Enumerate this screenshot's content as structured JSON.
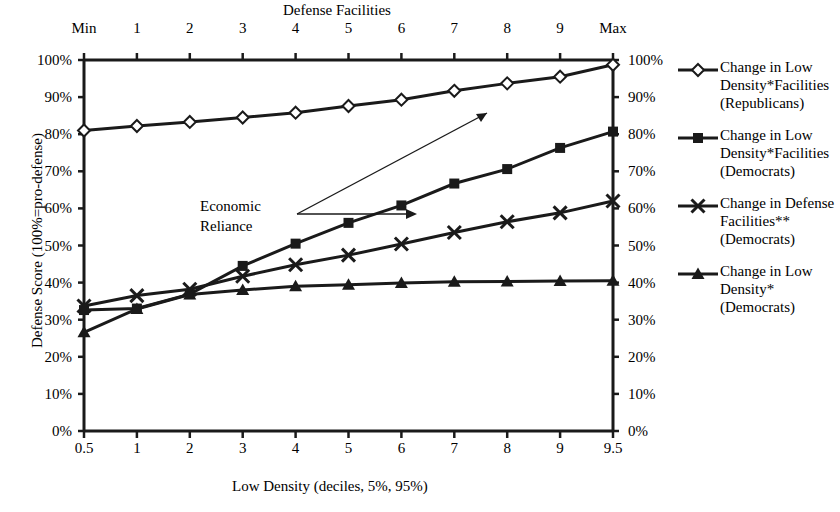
{
  "chart_data": {
    "type": "line",
    "title": "Defense Facilities",
    "xlabel": "Low Density (deciles, 5%, 95%)",
    "ylabel": "Defense Score (100%=pro-defense)",
    "ylim": [
      0,
      100
    ],
    "ytick_labels": [
      "0%",
      "10%",
      "20%",
      "30%",
      "40%",
      "50%",
      "60%",
      "70%",
      "80%",
      "90%",
      "100%"
    ],
    "ytick_values": [
      0,
      10,
      20,
      30,
      40,
      50,
      60,
      70,
      80,
      90,
      100
    ],
    "right_axis_labels": [
      "0%",
      "10%",
      "20%",
      "30%",
      "40%",
      "50%",
      "60%",
      "70%",
      "80%",
      "90%",
      "100%"
    ],
    "xtick_labels_bottom": [
      "0.5",
      "1",
      "2",
      "3",
      "4",
      "5",
      "6",
      "7",
      "8",
      "9",
      "9.5"
    ],
    "xtick_labels_top": [
      "Min",
      "1",
      "2",
      "3",
      "4",
      "5",
      "6",
      "7",
      "8",
      "9",
      "Max"
    ],
    "x": [
      0.5,
      1,
      2,
      3,
      4,
      5,
      6,
      7,
      8,
      9,
      9.5
    ],
    "grid": false,
    "legend_position": "right",
    "series": [
      {
        "name": "Change in Low Density*Facilities (Republicans)",
        "marker": "diamond-open",
        "values": [
          81.0,
          82.2,
          83.3,
          84.5,
          85.8,
          87.6,
          89.3,
          91.7,
          93.7,
          95.5,
          98.7
        ]
      },
      {
        "name": "Change in Low Density*Facilities (Democrats)",
        "marker": "square-filled",
        "values": [
          32.6,
          33.0,
          36.9,
          44.5,
          50.5,
          56.1,
          60.8,
          66.7,
          70.6,
          76.3,
          80.7
        ]
      },
      {
        "name": "Change in Defense Facilities** (Democrats)",
        "marker": "x-cross",
        "values": [
          33.7,
          36.5,
          38.2,
          41.7,
          44.8,
          47.4,
          50.4,
          53.5,
          56.4,
          58.8,
          62.0
        ]
      },
      {
        "name": "Change in Low Density* (Democrats)",
        "marker": "triangle-filled",
        "values": [
          26.6,
          32.9,
          36.8,
          38.0,
          39.0,
          39.4,
          39.9,
          40.2,
          40.3,
          40.4,
          40.5
        ]
      }
    ],
    "annotations": [
      {
        "text_line1": "Economic",
        "text_line2": "Reliance"
      }
    ]
  },
  "legend": {
    "entries": [
      {
        "line1": "Change in Low",
        "line2": "Density*Facilities",
        "line3": "(Republicans)",
        "marker": "diamond-open"
      },
      {
        "line1": "Change in Low",
        "line2": "Density*Facilities",
        "line3": "(Democrats)",
        "marker": "square-filled"
      },
      {
        "line1": "Change in Defense",
        "line2": "Facilities**",
        "line3": "(Democrats)",
        "marker": "x-cross"
      },
      {
        "line1": "Change in Low",
        "line2": "Density*",
        "line3": "(Democrats)",
        "marker": "triangle-filled"
      }
    ]
  },
  "colors": {
    "ink": "#1a1a1a",
    "background": "#ffffff"
  }
}
